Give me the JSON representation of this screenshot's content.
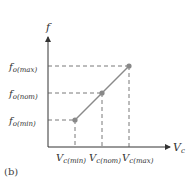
{
  "figure": {
    "caption": "(b)",
    "y_axis_label": "f",
    "x_axis_label": "V",
    "x_axis_sub": "c",
    "y_ticks": [
      {
        "main": "f",
        "sub": "o(max)"
      },
      {
        "main": "f",
        "sub": "o(nom)"
      },
      {
        "main": "f",
        "sub": "o(min)"
      }
    ],
    "x_ticks": [
      {
        "main": "V",
        "sub": "c(min)"
      },
      {
        "main": "V",
        "sub": "c(nom)"
      },
      {
        "main": "V",
        "sub": "c(max)"
      }
    ],
    "colors": {
      "axis": "#333333",
      "line": "#8a8a8a",
      "point": "#888888",
      "dashes": "#555555"
    }
  }
}
